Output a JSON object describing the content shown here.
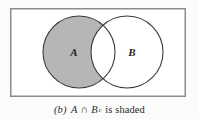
{
  "figure": {
    "caption": {
      "index": "(b)",
      "set_a": "A",
      "operator": "∩",
      "set_b": "B",
      "set_b_superscript": "c",
      "tail": "is shaded",
      "full_text": "(b)  A ∩ Bᶜ is shaded"
    },
    "labels": {
      "circle_a": "A",
      "circle_b": "B"
    },
    "colors": {
      "page_background": "#fbfbfb",
      "universe_fill": "#ffffff",
      "universe_stroke": "#8c8c8c",
      "circle_stroke": "#3a3a3a",
      "shaded_fill": "#b6b6b6",
      "unshaded_fill": "#ffffff",
      "text": "#2b2b2b"
    },
    "geometry": {
      "universe_rect": {
        "x": 10,
        "y": 8,
        "width": 176,
        "height": 89
      },
      "circle_a": {
        "cx": 79,
        "cy": 52,
        "r": 36
      },
      "circle_b": {
        "cx": 127,
        "cy": 52,
        "r": 36
      },
      "label_a_pos": {
        "x": 74,
        "y": 56
      },
      "label_b_pos": {
        "x": 132,
        "y": 56
      }
    },
    "shaded_region": "A ∩ B complement"
  }
}
